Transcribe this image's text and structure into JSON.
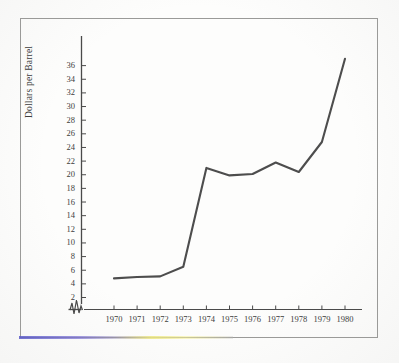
{
  "figure": {
    "kind": "scanned-line-chart",
    "frame_color": "#9a9a98",
    "ink_color": "#4a4a4a",
    "paper_color": "#fdfdfc"
  },
  "chart_data": {
    "type": "line",
    "title": "",
    "xlabel": "",
    "ylabel": "Dollars per Barrel",
    "x": [
      1970,
      1971,
      1972,
      1973,
      1974,
      1975,
      1976,
      1977,
      1978,
      1979,
      1980
    ],
    "values": [
      4.8,
      5.0,
      5.1,
      6.5,
      21.0,
      19.9,
      20.1,
      21.8,
      20.4,
      24.8,
      37.0
    ],
    "xtick_labels": [
      "1970",
      "1971",
      "1972",
      "1973",
      "1974",
      "1975",
      "1976",
      "1977",
      "1978",
      "1979",
      "1980"
    ],
    "ytick_labels": [
      "2",
      "4",
      "6",
      "8",
      "10",
      "12",
      "14",
      "16",
      "18",
      "20",
      "22",
      "24",
      "26",
      "28",
      "30",
      "32",
      "34",
      "36"
    ],
    "ytick_values": [
      2,
      4,
      6,
      8,
      10,
      12,
      14,
      16,
      18,
      20,
      22,
      24,
      26,
      28,
      30,
      32,
      34,
      36
    ],
    "ylim": [
      0,
      37.6
    ],
    "xlim": [
      1969.6,
      1980.4
    ],
    "grid": false,
    "legend": null,
    "axis_break": {
      "present": true,
      "axis": "x",
      "glyph": "zigzag",
      "note": "broken-axis zigzag between origin and first data point"
    },
    "line_style": "solid",
    "markers": false,
    "series_name": "Dollars per Barrel"
  },
  "axes": {
    "y_axis_name": "y-axis",
    "x_axis_name": "x-axis"
  }
}
